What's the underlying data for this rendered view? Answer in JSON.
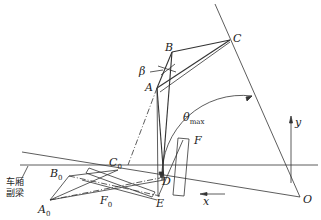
{
  "diagram": {
    "type": "mechanism-kinematics",
    "labels": {
      "C": "C",
      "B": "B",
      "beta": "β",
      "A": "A",
      "theta": "θ",
      "theta_sub": "max",
      "F": "F",
      "C0": "C",
      "C0_sub": "0",
      "B0": "B",
      "B0_sub": "0",
      "A0": "A",
      "A0_sub": "0",
      "F0": "F",
      "F0_sub": "0",
      "D": "D",
      "E": "E",
      "O": "O",
      "x": "x",
      "y": "y"
    },
    "annotation": {
      "line1": "车厢",
      "line2": "副梁"
    }
  }
}
